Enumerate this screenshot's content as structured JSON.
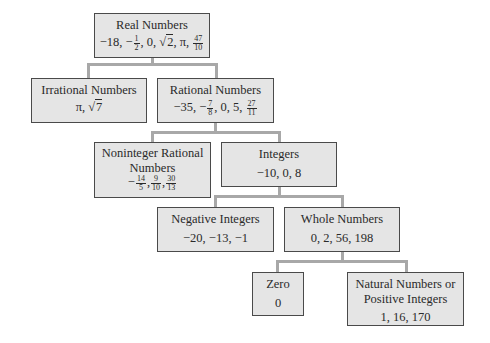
{
  "nodes": {
    "real": {
      "title": "Real Numbers",
      "examples_text": "−18, −1/2, 0, √2, π, 47/10",
      "prefix": "−18, −",
      "f1n": "1",
      "f1d": "2",
      "mid": ", 0, ",
      "sqrt_sym": "√",
      "sqrt_arg": "2",
      "mid2": ", π, ",
      "f2n": "47",
      "f2d": "10"
    },
    "irrational": {
      "title": "Irrational Numbers",
      "examples_text": "π, √7",
      "prefix": "π, ",
      "sqrt_sym": "√",
      "sqrt_arg": "7"
    },
    "rational": {
      "title": "Rational Numbers",
      "examples_text": "−35, −7/8, 0, 5, 27/11",
      "prefix": "−35, −",
      "f1n": "7",
      "f1d": "8",
      "mid": ", 0, 5, ",
      "f2n": "27",
      "f2d": "11"
    },
    "noninteger": {
      "title1": "Noninteger Rational",
      "title2": "Numbers",
      "examples_text": "−14/5, 9/10, 30/13",
      "prefix": "−",
      "f1n": "14",
      "f1d": "5",
      "sep1": ",",
      "f2n": "9",
      "f2d": "10",
      "sep2": ",",
      "f3n": "30",
      "f3d": "13"
    },
    "integers": {
      "title": "Integers",
      "examples": "−10, 0, 8"
    },
    "negative": {
      "title": "Negative Integers",
      "examples": "−20, −13, −1"
    },
    "whole": {
      "title": "Whole Numbers",
      "examples": "0, 2, 56, 198"
    },
    "zero": {
      "title": "Zero",
      "examples": "0"
    },
    "natural": {
      "title1": "Natural Numbers or",
      "title2": "Positive Integers",
      "examples": "1, 16, 170"
    }
  },
  "edges": [
    [
      "Real Numbers",
      "Irrational Numbers"
    ],
    [
      "Real Numbers",
      "Rational Numbers"
    ],
    [
      "Rational Numbers",
      "Noninteger Rational Numbers"
    ],
    [
      "Rational Numbers",
      "Integers"
    ],
    [
      "Integers",
      "Negative Integers"
    ],
    [
      "Integers",
      "Whole Numbers"
    ],
    [
      "Whole Numbers",
      "Zero"
    ],
    [
      "Whole Numbers",
      "Natural Numbers or Positive Integers"
    ]
  ],
  "colors": {
    "box_fill": "#e5e5e5",
    "box_border": "#4a4a4a",
    "connector": "#a8a8a8",
    "text": "#2a2a2a"
  }
}
